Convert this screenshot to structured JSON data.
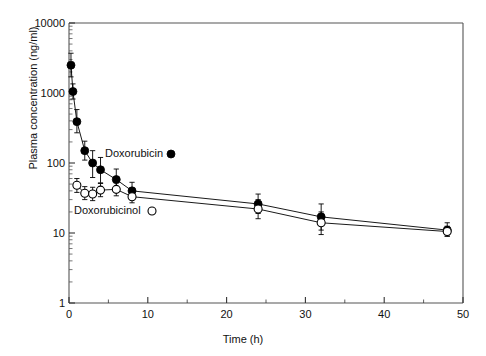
{
  "chart_data": {
    "type": "line",
    "title": "",
    "xlabel": "Time (h)",
    "ylabel": "Plasma concentration (ng/ml)",
    "xlim": [
      0,
      50
    ],
    "ylim": [
      1,
      10000
    ],
    "yscale": "log",
    "xticks": [
      0,
      5,
      10,
      15,
      20,
      25,
      30,
      35,
      40,
      45,
      50
    ],
    "xticklabels": [
      "0",
      "",
      "10",
      "",
      "20",
      "",
      "30",
      "",
      "40",
      "",
      "50"
    ],
    "yticks": [
      1,
      10,
      100,
      1000,
      10000
    ],
    "yticklabels": [
      "1",
      "10",
      "100",
      "1000",
      "10000"
    ],
    "grid": false,
    "legend_position": "inside-plot",
    "series": [
      {
        "name": "Doxorubicin",
        "marker": "filled-circle",
        "color": "#000000",
        "x": [
          0.25,
          0.5,
          1,
          2,
          3,
          4,
          6,
          8,
          24,
          32,
          48
        ],
        "y": [
          2500,
          1050,
          390,
          150,
          100,
          80,
          58,
          40,
          26,
          17,
          11
        ],
        "yerr_low": [
          1700,
          820,
          270,
          110,
          62,
          52,
          40,
          30,
          19,
          11,
          9
        ],
        "yerr_high": [
          3700,
          1350,
          580,
          205,
          150,
          120,
          82,
          53,
          36,
          26,
          14
        ]
      },
      {
        "name": "Doxorubicinol",
        "marker": "open-circle",
        "color": "#000000",
        "x": [
          1,
          2,
          3,
          4,
          6,
          8,
          24,
          32,
          48
        ],
        "y": [
          48,
          37,
          36,
          41,
          42,
          33,
          22,
          14,
          10.5
        ],
        "yerr_low": [
          38,
          30,
          29,
          33,
          34,
          27,
          16,
          9.5,
          9
        ],
        "yerr_high": [
          60,
          46,
          45,
          51,
          52,
          41,
          30,
          20,
          12.5
        ]
      }
    ],
    "annotations": [
      {
        "name": "doxorubicin-legend-label",
        "text": "Doxorubicin",
        "x": 105,
        "y": 157,
        "marker": "filled-circle",
        "marker_x": 171,
        "marker_y": 154
      },
      {
        "name": "doxorubicinol-legend-label",
        "text": "Doxorubicinol",
        "x": 74,
        "y": 214,
        "marker": "open-circle",
        "marker_x": 152,
        "marker_y": 211
      }
    ]
  },
  "axes": {
    "x_label": "Time (h)",
    "y_label": "Plasma concentration (ng/ml)"
  }
}
